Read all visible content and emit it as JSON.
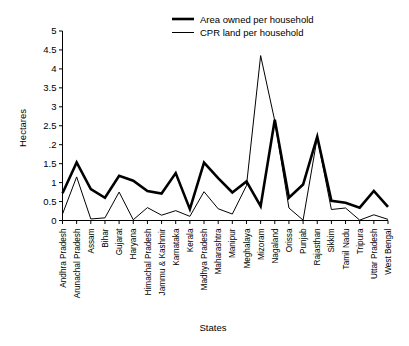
{
  "chart_data": {
    "type": "line",
    "title": "",
    "xlabel": "States",
    "ylabel": "Hectares",
    "ylim": [
      0,
      5
    ],
    "yticks": [
      "0",
      "0.5",
      "1",
      "1.5",
      ".2",
      "2.5",
      "3",
      "3.5",
      "4",
      "4.5",
      "5"
    ],
    "ytick_values": [
      0,
      0.5,
      1,
      1.5,
      2,
      2.5,
      3,
      3.5,
      4,
      4.5,
      5
    ],
    "grid": false,
    "legend_position": "top-center",
    "categories": [
      "Andhra Pradesh",
      "Arunachal Pradesh",
      "Assam",
      "Bihar",
      "Gujarat",
      "Haryana",
      "Himachal Pradesh",
      "Jammu & Kashmir",
      "Karnataka",
      "Kerala",
      "Madhya Pradesh",
      "Maharashtra",
      "Manipur",
      "Meghalaya",
      "Mizoram",
      "Nagaland",
      "Orissa",
      "Punjab",
      "Rajasthan",
      "Sikkim",
      "Tamil Nadu",
      "Tripura",
      "Uttar Pradesh",
      "West Bengal"
    ],
    "series": [
      {
        "name": "Area owned per household",
        "style": "thick",
        "values": [
          0.72,
          1.53,
          0.83,
          0.6,
          1.18,
          1.05,
          0.78,
          0.71,
          1.25,
          0.3,
          1.53,
          1.12,
          0.74,
          1.03,
          0.38,
          2.66,
          0.6,
          0.95,
          2.21,
          0.52,
          0.47,
          0.34,
          0.78,
          0.36
        ]
      },
      {
        "name": "CPR land per household",
        "style": "thin",
        "values": [
          0.17,
          1.15,
          0.04,
          0.07,
          0.75,
          0.02,
          0.34,
          0.14,
          0.26,
          0.11,
          0.76,
          0.31,
          0.17,
          0.92,
          4.35,
          2.63,
          0.33,
          0.01,
          2.19,
          0.29,
          0.33,
          0.01,
          0.15,
          0.03
        ]
      }
    ]
  },
  "legend": {
    "items": [
      {
        "label": "Area owned per household",
        "style": "thick"
      },
      {
        "label": "CPR land per household",
        "style": "thin"
      }
    ]
  },
  "axes": {
    "y_title": "Hectares",
    "x_title": "States"
  }
}
